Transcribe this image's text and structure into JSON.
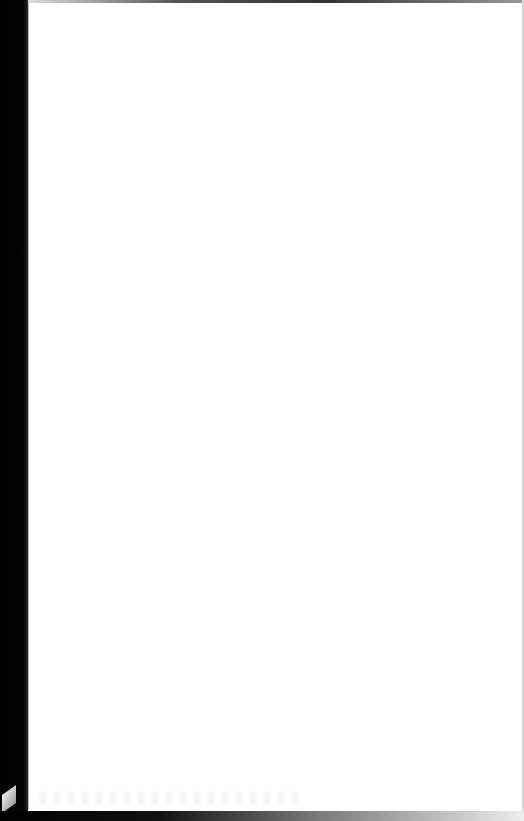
{
  "document": {
    "type": "scanned-page",
    "content": "",
    "state": "blank"
  },
  "colors": {
    "page": "#ffffff",
    "binding": "#000000"
  }
}
